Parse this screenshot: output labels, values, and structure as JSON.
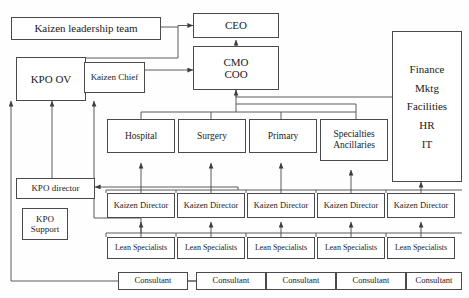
{
  "diagram": {
    "type": "org-chart",
    "line_color": "#4a4a4a",
    "box_fill": "#ffffff",
    "background": "#fefefe"
  },
  "nodes": {
    "kaizen_leadership_team": "Kaizen leadership team",
    "kpo_ov": "KPO OV",
    "kaizen_chief": "Kaizen Chief",
    "ceo": "CEO",
    "cmo": "CMO",
    "coo": "COO",
    "kpo_director": "KPO director",
    "kpo_support_line1": "KPO",
    "kpo_support_line2": "Support"
  },
  "support_column": {
    "items": [
      "Finance",
      "Mktg",
      "Facilities",
      "HR",
      "IT"
    ]
  },
  "service_lines": [
    {
      "label": "Hospital",
      "label2": ""
    },
    {
      "label": "Surgery",
      "label2": ""
    },
    {
      "label": "Primary",
      "label2": ""
    },
    {
      "label": "Specialties",
      "label2": "Ancillaries"
    }
  ],
  "kaizen_directors": [
    "Kaizen Director",
    "Kaizen Director",
    "Kaizen Director",
    "Kaizen Director",
    "Kaizen Director"
  ],
  "lean_specialists": [
    "Lean Specialists",
    "Lean Specialists",
    "Lean Specialists",
    "Lean Specialists",
    "Lean Specialists"
  ],
  "consultants": [
    "Consultant",
    "Consultant",
    "Consultant",
    "Consultant",
    "Consultant"
  ]
}
